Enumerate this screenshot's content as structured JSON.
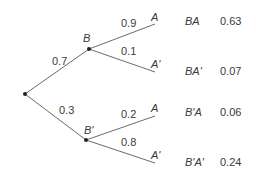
{
  "tree": {
    "root": {
      "x": 25,
      "y": 94
    },
    "level1": [
      {
        "node": "B",
        "prob": "0.7",
        "x": 89,
        "y": 49
      },
      {
        "node": "B'",
        "prob": "0.3",
        "x": 86,
        "y": 140
      }
    ],
    "level2": [
      {
        "parent": "B",
        "node": "A",
        "prob": "0.9",
        "outcome": "BA",
        "value": "0.63"
      },
      {
        "parent": "B",
        "node": "A'",
        "prob": "0.1",
        "outcome": "BA'",
        "value": "0.07"
      },
      {
        "parent": "B'",
        "node": "A",
        "prob": "0.2",
        "outcome": "B'A",
        "value": "0.06"
      },
      {
        "parent": "B'",
        "node": "A'",
        "prob": "0.8",
        "outcome": "B'A'",
        "value": "0.24"
      }
    ]
  },
  "colors": {
    "line": "#666666",
    "text": "#3a3a3a",
    "dot": "#222222"
  }
}
